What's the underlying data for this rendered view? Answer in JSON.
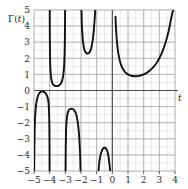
{
  "chart_data": {
    "type": "line",
    "title": "",
    "subtitle": "",
    "xlabel": "t",
    "ylabel": "Γ(t)",
    "xlim": [
      -5,
      4
    ],
    "ylim": [
      -5,
      5
    ],
    "grid": true,
    "grid_minor_step": 0.5,
    "grid_major_step": 1,
    "legend": "none",
    "xticks": [
      -5,
      -4,
      -3,
      -2,
      -1,
      0,
      1,
      2,
      3,
      4
    ],
    "xtick_labels": [
      "−5",
      "−4",
      "−3",
      "−2",
      "−1",
      "0",
      "1",
      "2",
      "3",
      "4"
    ],
    "yticks": [
      -5,
      -4,
      -3,
      -2,
      -1,
      0,
      1,
      2,
      3,
      4,
      5
    ],
    "ytick_labels": [
      "−5",
      "−4",
      "−3",
      "−2",
      "−1",
      "0",
      "1",
      "2",
      "3",
      "4",
      "5"
    ],
    "axis_label_x_text": "t",
    "axis_label_y_text": "Γ(t)",
    "curve_color": "#111111",
    "grid_minor_color": "#d8d8d8",
    "grid_major_color": "#a8a8a8",
    "axis_color": "#4a4a4a",
    "poles": [
      -5,
      -4,
      -3,
      -2,
      -1,
      0
    ],
    "branches": [
      {
        "name": "branch-neg5-neg4",
        "domain": [
          -5,
          -4
        ],
        "sign": "negative",
        "local_extremum": {
          "t": -4.48,
          "value": -0.06
        },
        "points": [
          [
            -4.99,
            -5.0
          ],
          [
            -4.97,
            -3.2
          ],
          [
            -4.95,
            -2.2
          ],
          [
            -4.92,
            -1.5
          ],
          [
            -4.88,
            -1.0
          ],
          [
            -4.82,
            -0.6
          ],
          [
            -4.75,
            -0.34
          ],
          [
            -4.68,
            -0.2
          ],
          [
            -4.6,
            -0.11
          ],
          [
            -4.52,
            -0.07
          ],
          [
            -4.48,
            -0.06
          ],
          [
            -4.42,
            -0.07
          ],
          [
            -4.34,
            -0.1
          ],
          [
            -4.26,
            -0.17
          ],
          [
            -4.18,
            -0.3
          ],
          [
            -4.12,
            -0.48
          ],
          [
            -4.07,
            -0.78
          ],
          [
            -4.04,
            -1.3
          ],
          [
            -4.02,
            -2.2
          ],
          [
            -4.01,
            -3.4
          ],
          [
            -4.005,
            -5.0
          ]
        ]
      },
      {
        "name": "branch-neg4-neg3",
        "domain": [
          -4,
          -3
        ],
        "sign": "positive",
        "local_extremum": {
          "t": -3.55,
          "value": 0.27
        },
        "points": [
          [
            -3.995,
            5.0
          ],
          [
            -3.99,
            3.4
          ],
          [
            -3.98,
            2.3
          ],
          [
            -3.96,
            1.5
          ],
          [
            -3.93,
            1.0
          ],
          [
            -3.89,
            0.7
          ],
          [
            -3.84,
            0.5
          ],
          [
            -3.78,
            0.38
          ],
          [
            -3.71,
            0.31
          ],
          [
            -3.63,
            0.28
          ],
          [
            -3.55,
            0.27
          ],
          [
            -3.47,
            0.28
          ],
          [
            -3.39,
            0.32
          ],
          [
            -3.31,
            0.4
          ],
          [
            -3.24,
            0.52
          ],
          [
            -3.17,
            0.75
          ],
          [
            -3.12,
            1.05
          ],
          [
            -3.08,
            1.5
          ],
          [
            -3.05,
            2.2
          ],
          [
            -3.03,
            3.2
          ],
          [
            -3.015,
            5.0
          ]
        ]
      },
      {
        "name": "branch-neg3-neg2",
        "domain": [
          -3,
          -2
        ],
        "sign": "negative",
        "local_extremum": {
          "t": -2.61,
          "value": -1.13
        },
        "points": [
          [
            -2.985,
            -5.0
          ],
          [
            -2.97,
            -3.4
          ],
          [
            -2.95,
            -2.4
          ],
          [
            -2.92,
            -1.9
          ],
          [
            -2.88,
            -1.55
          ],
          [
            -2.83,
            -1.33
          ],
          [
            -2.77,
            -1.21
          ],
          [
            -2.7,
            -1.15
          ],
          [
            -2.61,
            -1.13
          ],
          [
            -2.52,
            -1.15
          ],
          [
            -2.44,
            -1.22
          ],
          [
            -2.36,
            -1.35
          ],
          [
            -2.28,
            -1.58
          ],
          [
            -2.21,
            -1.95
          ],
          [
            -2.15,
            -2.45
          ],
          [
            -2.1,
            -3.1
          ],
          [
            -2.06,
            -3.9
          ],
          [
            -2.03,
            -5.0
          ]
        ]
      },
      {
        "name": "branch-neg2-neg1",
        "domain": [
          -2,
          -1
        ],
        "sign": "positive",
        "local_extremum": {
          "t": -1.57,
          "value": 2.3
        },
        "points": [
          [
            -1.97,
            5.0
          ],
          [
            -1.95,
            4.2
          ],
          [
            -1.92,
            3.6
          ],
          [
            -1.88,
            3.1
          ],
          [
            -1.83,
            2.75
          ],
          [
            -1.77,
            2.5
          ],
          [
            -1.7,
            2.37
          ],
          [
            -1.63,
            2.31
          ],
          [
            -1.57,
            2.3
          ],
          [
            -1.5,
            2.33
          ],
          [
            -1.43,
            2.42
          ],
          [
            -1.36,
            2.6
          ],
          [
            -1.29,
            2.9
          ],
          [
            -1.23,
            3.3
          ],
          [
            -1.18,
            3.8
          ],
          [
            -1.13,
            4.4
          ],
          [
            -1.09,
            5.0
          ]
        ]
      },
      {
        "name": "branch-neg1-0",
        "domain": [
          -1,
          0
        ],
        "sign": "negative",
        "local_extremum": {
          "t": -0.5,
          "value": -3.54
        },
        "points": [
          [
            -0.88,
            -5.0
          ],
          [
            -0.84,
            -4.55
          ],
          [
            -0.8,
            -4.25
          ],
          [
            -0.75,
            -4.0
          ],
          [
            -0.7,
            -3.82
          ],
          [
            -0.64,
            -3.68
          ],
          [
            -0.58,
            -3.59
          ],
          [
            -0.5,
            -3.545
          ],
          [
            -0.43,
            -3.57
          ],
          [
            -0.37,
            -3.65
          ],
          [
            -0.31,
            -3.81
          ],
          [
            -0.26,
            -4.02
          ],
          [
            -0.21,
            -4.35
          ],
          [
            -0.17,
            -4.7
          ],
          [
            -0.14,
            -5.0
          ]
        ]
      },
      {
        "name": "branch-positive",
        "domain": [
          0,
          4
        ],
        "sign": "positive",
        "local_extremum": {
          "t": 1.4616,
          "value": 0.8856
        },
        "points": [
          [
            0.2,
            4.59
          ],
          [
            0.22,
            4.14
          ],
          [
            0.25,
            3.62
          ],
          [
            0.28,
            3.19
          ],
          [
            0.32,
            2.78
          ],
          [
            0.36,
            2.45
          ],
          [
            0.4,
            2.22
          ],
          [
            0.45,
            1.97
          ],
          [
            0.5,
            1.77
          ],
          [
            0.56,
            1.59
          ],
          [
            0.62,
            1.45
          ],
          [
            0.7,
            1.3
          ],
          [
            0.8,
            1.16
          ],
          [
            0.9,
            1.07
          ],
          [
            1.0,
            1.0
          ],
          [
            1.1,
            0.95
          ],
          [
            1.2,
            0.918
          ],
          [
            1.3,
            0.897
          ],
          [
            1.4616,
            0.8856
          ],
          [
            1.6,
            0.894
          ],
          [
            1.8,
            0.931
          ],
          [
            2.0,
            1.0
          ],
          [
            2.2,
            1.102
          ],
          [
            2.4,
            1.242
          ],
          [
            2.6,
            1.429
          ],
          [
            2.8,
            1.676
          ],
          [
            3.0,
            2.0
          ],
          [
            3.2,
            2.424
          ],
          [
            3.4,
            2.981
          ],
          [
            3.6,
            3.717
          ],
          [
            3.8,
            4.694
          ],
          [
            3.88,
            5.0
          ]
        ]
      }
    ]
  }
}
